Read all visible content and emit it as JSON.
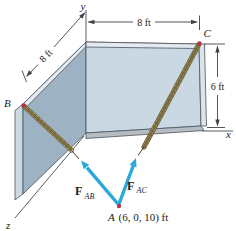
{
  "figure": {
    "axis_labels": {
      "x": "x",
      "y": "y",
      "z": "z"
    },
    "points": {
      "a_label": "A",
      "a_coords": "(6, 0, 10) ft",
      "b_label": "B",
      "c_label": "C"
    },
    "dimensions": {
      "top_width": "8 ft",
      "left_depth": "8 ft",
      "right_height": "6 ft"
    },
    "forces": {
      "bold_symbol": "F",
      "ab_subscript": "AB",
      "ac_subscript": "AC"
    },
    "colors": {
      "background": "#ffffff",
      "front_wall": "#c9d8e3",
      "side_wall": "#9db2c3",
      "wall_top_band": "#e4eaef",
      "wall_right_band": "#dde4e9",
      "wall_side_strip": "#ccd7e0",
      "floor_strip": "#b5bdc3",
      "rope_fill": "#d9cfa0",
      "rope_outline": "#6a5a2e",
      "force_arrow": "#2aa7dd",
      "point_marker": "#b03347",
      "line_dark": "#3d4348"
    }
  }
}
